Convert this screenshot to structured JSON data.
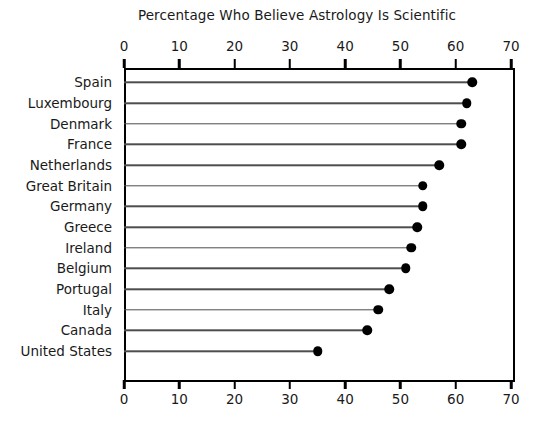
{
  "chart_data": {
    "type": "bar",
    "subtype": "lollipop-dot-plot",
    "title": "Percentage Who Believe Astrology Is Scientific",
    "xlabel": "",
    "ylabel": "",
    "xlim": [
      0,
      70
    ],
    "xticks": [
      0,
      10,
      20,
      30,
      40,
      50,
      60,
      70
    ],
    "xtick_labels": [
      "0",
      "10",
      "20",
      "30",
      "40",
      "50",
      "60",
      "70"
    ],
    "axis_positions": [
      "top",
      "bottom"
    ],
    "grid": false,
    "legend": false,
    "orientation": "horizontal",
    "marker_color": "#000000",
    "stem_color": "#4d4d4d",
    "categories": [
      "Spain",
      "Luxembourg",
      "Denmark",
      "France",
      "Netherlands",
      "Great Britain",
      "Germany",
      "Greece",
      "Ireland",
      "Belgium",
      "Portugal",
      "Italy",
      "Canada",
      "United States"
    ],
    "values": [
      63,
      62,
      61,
      61,
      57,
      54,
      54,
      53,
      52,
      51,
      48,
      46,
      44,
      35
    ]
  }
}
